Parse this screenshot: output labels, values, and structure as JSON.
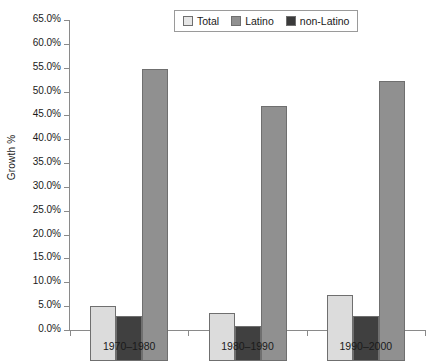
{
  "chart_data": {
    "type": "bar",
    "title": "",
    "xlabel": "",
    "ylabel": "Growth %",
    "ylim": [
      0,
      65
    ],
    "ytick_step": 5,
    "grid": false,
    "legend_position": "top-center",
    "categories": [
      "1970–1980",
      "1980–1990",
      "1990–2000"
    ],
    "series": [
      {
        "name": "Total",
        "color": "#dcdcdc",
        "values": [
          11.6,
          10.1,
          13.9
        ]
      },
      {
        "name": "non-Latino",
        "color": "#404040",
        "values": [
          9.4,
          7.3,
          9.5
        ]
      },
      {
        "name": "Latino",
        "color": "#909090",
        "values": [
          61.3,
          53.5,
          58.7
        ]
      }
    ],
    "ytick_labels": [
      "0.0%",
      "5.0%",
      "10.0%",
      "15.0%",
      "20.0%",
      "25.0%",
      "30.0%",
      "35.0%",
      "40.0%",
      "45.0%",
      "50.0%",
      "55.0%",
      "60.0%",
      "65.0%"
    ]
  },
  "legend": {
    "items": [
      {
        "label": "Total",
        "swatch": "total"
      },
      {
        "label": "Latino",
        "swatch": "latino"
      },
      {
        "label": "non-Latino",
        "swatch": "nonlatino"
      }
    ]
  }
}
